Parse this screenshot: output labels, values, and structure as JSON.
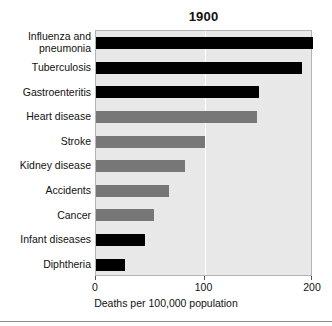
{
  "chart_data": {
    "type": "bar",
    "orientation": "horizontal",
    "title": "1900",
    "xlabel": "Deaths per 100,000 population",
    "ylabel": "",
    "xlim": [
      0,
      200
    ],
    "xticks": [
      0,
      100,
      200
    ],
    "xtick_labels": [
      "0",
      "100",
      "200"
    ],
    "grid": "vertical-white-at-100",
    "legend": "none",
    "categories": [
      "Influenza and pneumonia",
      "Tuberculosis",
      "Gastroenteritis",
      "Heart disease",
      "Stroke",
      "Kidney disease",
      "Accidents",
      "Cancer",
      "Infant diseases",
      "Diphtheria"
    ],
    "values": [
      200,
      190,
      150,
      148,
      100,
      82,
      67,
      53,
      45,
      27
    ],
    "bar_colors": [
      "#000000",
      "#000000",
      "#000000",
      "#777777",
      "#777777",
      "#777777",
      "#777777",
      "#777777",
      "#000000",
      "#000000"
    ],
    "bars": [
      {
        "label_line1": "Influenza and",
        "label_line2": "pneumonia",
        "value": 200,
        "color": "#000000"
      },
      {
        "label_line1": "Tuberculosis",
        "label_line2": "",
        "value": 190,
        "color": "#000000"
      },
      {
        "label_line1": "Gastroenteritis",
        "label_line2": "",
        "value": 150,
        "color": "#000000"
      },
      {
        "label_line1": "Heart disease",
        "label_line2": "",
        "value": 148,
        "color": "#777777"
      },
      {
        "label_line1": "Stroke",
        "label_line2": "",
        "value": 100,
        "color": "#777777"
      },
      {
        "label_line1": "Kidney disease",
        "label_line2": "",
        "value": 82,
        "color": "#777777"
      },
      {
        "label_line1": "Accidents",
        "label_line2": "",
        "value": 67,
        "color": "#777777"
      },
      {
        "label_line1": "Cancer",
        "label_line2": "",
        "value": 53,
        "color": "#777777"
      },
      {
        "label_line1": "Infant diseases",
        "label_line2": "",
        "value": 45,
        "color": "#000000"
      },
      {
        "label_line1": "Diphtheria",
        "label_line2": "",
        "value": 27,
        "color": "#000000"
      }
    ],
    "colors": {
      "plot_background": "#e8e8e8",
      "plot_border": "#b4b4b4",
      "gridline": "#ffffff",
      "bar_dark": "#000000",
      "bar_gray": "#777777",
      "text": "#111111",
      "figure_background": "#ffffff"
    }
  }
}
